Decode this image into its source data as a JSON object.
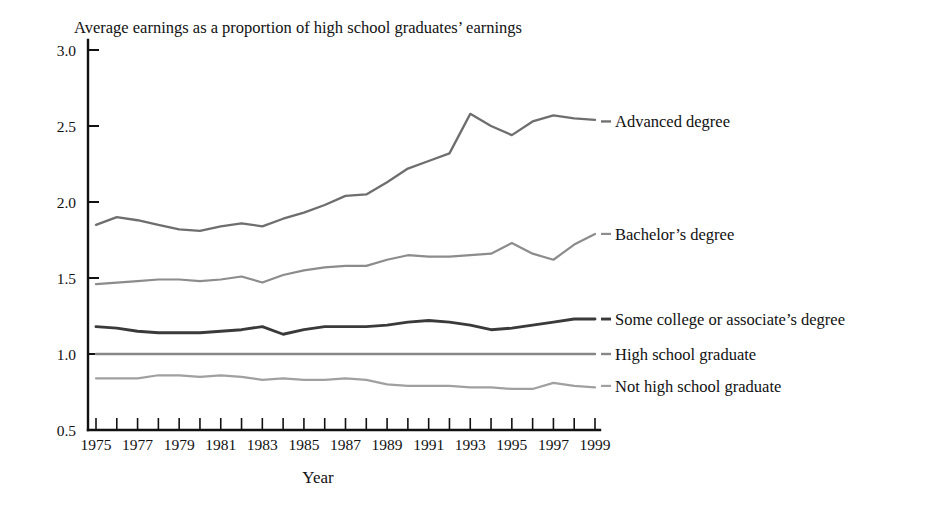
{
  "chart_data": {
    "type": "line",
    "title": "Average earnings as a proportion of high school graduates’ earnings",
    "xlabel": "Year",
    "ylabel": "",
    "xlim": [
      1975,
      1999
    ],
    "ylim": [
      0.5,
      3.0
    ],
    "y_ticks": [
      "0.5",
      "1.0",
      "1.5",
      "2.0",
      "2.5",
      "3.0"
    ],
    "y_tick_values": [
      0.5,
      1.0,
      1.5,
      2.0,
      2.5,
      3.0
    ],
    "x_ticks_all": [
      1975,
      1976,
      1977,
      1978,
      1979,
      1980,
      1981,
      1982,
      1983,
      1984,
      1985,
      1986,
      1987,
      1988,
      1989,
      1990,
      1991,
      1992,
      1993,
      1994,
      1995,
      1996,
      1997,
      1998,
      1999
    ],
    "x_tick_labels": [
      "1975",
      "1977",
      "1979",
      "1981",
      "1983",
      "1985",
      "1987",
      "1989",
      "1991",
      "1993",
      "1995",
      "1997",
      "1999"
    ],
    "x_tick_label_values": [
      1975,
      1977,
      1979,
      1981,
      1983,
      1985,
      1987,
      1989,
      1991,
      1993,
      1995,
      1997,
      1999
    ],
    "grid": false,
    "legend_position": "right-inline",
    "x": [
      1975,
      1976,
      1977,
      1978,
      1979,
      1980,
      1981,
      1982,
      1983,
      1984,
      1985,
      1986,
      1987,
      1988,
      1989,
      1990,
      1991,
      1992,
      1993,
      1994,
      1995,
      1996,
      1997,
      1998,
      1999
    ],
    "series": [
      {
        "name": "Advanced degree",
        "color": "#6e6e6e",
        "width": 2.3,
        "label_y": 2.53,
        "values": [
          1.85,
          1.9,
          1.88,
          1.85,
          1.82,
          1.81,
          1.84,
          1.86,
          1.84,
          1.89,
          1.93,
          1.98,
          2.04,
          2.05,
          2.13,
          2.22,
          2.27,
          2.32,
          2.58,
          2.5,
          2.44,
          2.53,
          2.57,
          2.55,
          2.54
        ]
      },
      {
        "name": "Bachelor’s degree",
        "color": "#8c8c8c",
        "width": 2.2,
        "label_y": 1.79,
        "values": [
          1.46,
          1.47,
          1.48,
          1.49,
          1.49,
          1.48,
          1.49,
          1.51,
          1.47,
          1.52,
          1.55,
          1.57,
          1.58,
          1.58,
          1.62,
          1.65,
          1.64,
          1.64,
          1.65,
          1.66,
          1.73,
          1.66,
          1.62,
          1.72,
          1.79
        ]
      },
      {
        "name": "Some college or associate’s degree",
        "color": "#3a3a3a",
        "width": 2.9,
        "label_y": 1.23,
        "values": [
          1.18,
          1.17,
          1.15,
          1.14,
          1.14,
          1.14,
          1.15,
          1.16,
          1.18,
          1.13,
          1.16,
          1.18,
          1.18,
          1.18,
          1.19,
          1.21,
          1.22,
          1.21,
          1.19,
          1.16,
          1.17,
          1.19,
          1.21,
          1.23,
          1.23
        ]
      },
      {
        "name": "High school graduate",
        "color": "#878787",
        "width": 2.4,
        "label_y": 1.0,
        "values": [
          1.0,
          1.0,
          1.0,
          1.0,
          1.0,
          1.0,
          1.0,
          1.0,
          1.0,
          1.0,
          1.0,
          1.0,
          1.0,
          1.0,
          1.0,
          1.0,
          1.0,
          1.0,
          1.0,
          1.0,
          1.0,
          1.0,
          1.0,
          1.0,
          1.0
        ]
      },
      {
        "name": "Not high school graduate",
        "color": "#a0a0a0",
        "width": 2.2,
        "label_y": 0.79,
        "values": [
          0.84,
          0.84,
          0.84,
          0.86,
          0.86,
          0.85,
          0.86,
          0.85,
          0.83,
          0.84,
          0.83,
          0.83,
          0.84,
          0.83,
          0.8,
          0.79,
          0.79,
          0.79,
          0.78,
          0.78,
          0.77,
          0.77,
          0.81,
          0.79,
          0.78
        ]
      }
    ]
  },
  "colors": {
    "axis": "#111111",
    "text": "#111111",
    "background": "#ffffff"
  }
}
